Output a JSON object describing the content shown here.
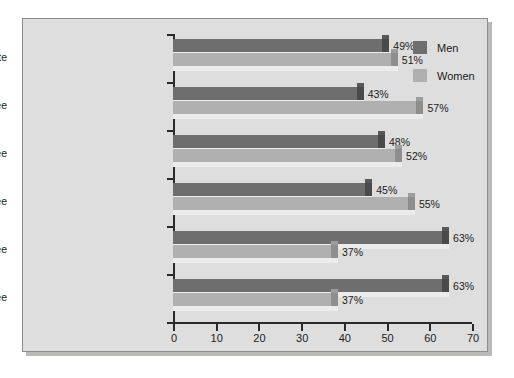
{
  "chart_data": {
    "type": "bar",
    "orientation": "horizontal",
    "title": "",
    "subtitle": "",
    "xlabel": "",
    "ylabel": "",
    "xlim": [
      0,
      70
    ],
    "xticks": [
      "0",
      "10",
      "20",
      "30",
      "40",
      "50",
      "60",
      "70"
    ],
    "grid": false,
    "legend_position": "top-right",
    "categories": [
      "High school graduate",
      "Associate's degree",
      "Bachelor's degree",
      "Master's degree",
      "Professional degree",
      "Doctoral degree"
    ],
    "series": [
      {
        "name": "Men",
        "color": "#6e6e6e",
        "values": [
          49,
          43,
          48,
          45,
          63,
          63
        ],
        "labels": [
          "49%",
          "43%",
          "48%",
          "45%",
          "63%",
          "63%"
        ]
      },
      {
        "name": "Women",
        "color": "#b0b0b0",
        "values": [
          51,
          57,
          52,
          55,
          37,
          37
        ],
        "labels": [
          "51%",
          "57%",
          "52%",
          "55%",
          "37%",
          "37%"
        ]
      }
    ]
  },
  "legend": {
    "items": [
      {
        "label": "Men",
        "color": "#6e6e6e"
      },
      {
        "label": "Women",
        "color": "#b0b0b0"
      }
    ]
  },
  "colors": {
    "panel_background": "#dedede",
    "panel_border": "#8d8d8d",
    "axis": "#2a2a2a",
    "text": "#1b1b1b",
    "men": "#6e6e6e",
    "women": "#b0b0b0"
  }
}
